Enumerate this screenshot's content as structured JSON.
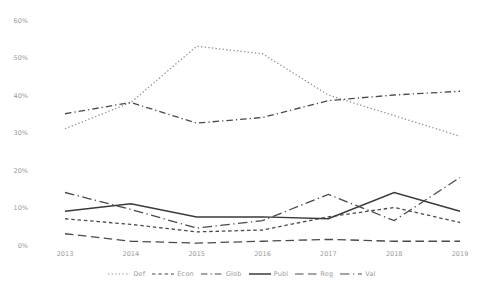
{
  "chart_data": {
    "type": "line",
    "title": "",
    "xlabel": "",
    "ylabel": "",
    "categories": [
      "2013",
      "2014",
      "2015",
      "2016",
      "2017",
      "2018",
      "2019"
    ],
    "series": [
      {
        "name": "Def",
        "style": "dotted",
        "color": "#8f8f8f",
        "values": [
          31,
          38,
          53,
          51,
          40,
          34.5,
          29
        ]
      },
      {
        "name": "Econ",
        "style": "dash",
        "color": "#4a4a4a",
        "values": [
          7,
          5.5,
          3.5,
          4,
          7.5,
          10,
          6
        ]
      },
      {
        "name": "Glob",
        "style": "dashdot",
        "color": "#4a4a4a",
        "values": [
          35,
          38,
          32.5,
          34,
          38.5,
          40,
          41
        ]
      },
      {
        "name": "Publ",
        "style": "solid",
        "color": "#3a3a3a",
        "values": [
          9,
          11,
          7.5,
          7.5,
          7,
          14,
          9
        ]
      },
      {
        "name": "Reg",
        "style": "longdash",
        "color": "#4a4a4a",
        "values": [
          3,
          1,
          0.5,
          1,
          1.5,
          1,
          1
        ]
      },
      {
        "name": "Val",
        "style": "longdashdot",
        "color": "#4a4a4a",
        "values": [
          14,
          9.5,
          4.5,
          6.5,
          13.5,
          6.5,
          18
        ]
      }
    ],
    "ylim": [
      0,
      60
    ],
    "ytick_step": 10,
    "ytick_labels": [
      "0%",
      "10%",
      "20%",
      "30%",
      "40%",
      "50%",
      "60%"
    ],
    "grid": false,
    "legend_position": "bottom",
    "legend_order": [
      "Def",
      "Econ",
      "Glob",
      "Publ",
      "Reg",
      "Val"
    ]
  },
  "colors": {
    "background": "#ffffff",
    "axis_text": "#9b9b9b",
    "legend_text": "#9b9b9b"
  }
}
